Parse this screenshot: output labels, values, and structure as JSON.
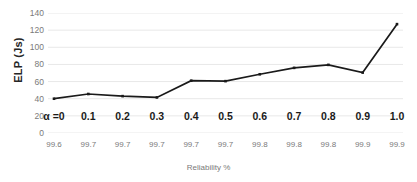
{
  "chart_data": {
    "type": "line",
    "title": "",
    "xlabel": "Reliability %",
    "ylabel": "ELP (Js)",
    "ylim": [
      0,
      140
    ],
    "yticks": [
      0,
      20,
      40,
      60,
      80,
      100,
      120,
      140
    ],
    "grid": true,
    "legend": "none",
    "categories": [
      "99.6",
      "99.7",
      "99.7",
      "99.7",
      "99.7",
      "99.7",
      "99.8",
      "99.8",
      "99.8",
      "99.9",
      "99.9"
    ],
    "point_labels": [
      "α =0",
      "0.1",
      "0.2",
      "0.3",
      "0.4",
      "0.5",
      "0.6",
      "0.7",
      "0.8",
      "0.9",
      "1.0"
    ],
    "series": [
      {
        "name": "ELP",
        "values": [
          40,
          45.5,
          43,
          41.5,
          61,
          60.5,
          68.5,
          76,
          79.5,
          70.5,
          127
        ],
        "color": "#1a1a1a",
        "marker": "square"
      }
    ]
  },
  "style": {
    "line_color": "#1a1a1a",
    "grid_color": "#e8e8e8",
    "tick_text_color": "#7a7a7a",
    "axis_title_color": "#262626",
    "background": "#ffffff"
  }
}
